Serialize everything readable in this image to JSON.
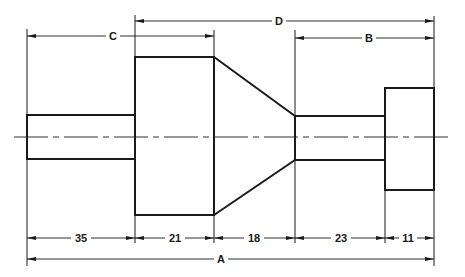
{
  "drawing": {
    "title": "Stepped shaft dimensioning exercise",
    "colors": {
      "line": "#1a1a1a",
      "background": "#ffffff"
    },
    "top_dimensions": {
      "C": {
        "label": "C"
      },
      "D": {
        "label": "D"
      },
      "B": {
        "label": "B"
      }
    },
    "bottom_dimensions": [
      {
        "label": "35"
      },
      {
        "label": "21"
      },
      {
        "label": "18"
      },
      {
        "label": "23"
      },
      {
        "label": "11"
      }
    ],
    "overall_dimension": {
      "label": "A"
    },
    "parts": [
      "left-shaft",
      "large-cylinder",
      "taper-cone",
      "middle-shaft",
      "end-head"
    ]
  }
}
